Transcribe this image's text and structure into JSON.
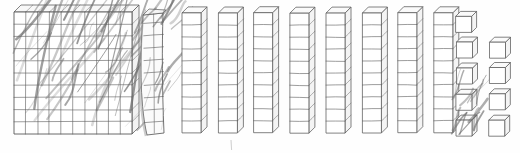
{
  "scene": {
    "title": "Base-Ten Blocks Place-Value Illustration",
    "medium": "pencil-sketch-scan",
    "canvas": {
      "width": 520,
      "height": 153
    },
    "background_color": "#fefefe",
    "ink_color": "#4a4a4a",
    "line_color": "#5a5a5a",
    "face_color": "#ffffff",
    "scribble_color": "#6b6b6b",
    "shadow_color": "#9a9a9a"
  },
  "legend": {
    "flat_name": "flat",
    "flat_value_label": "100",
    "rod_name": "rod",
    "rod_value_label": "10",
    "unit_name": "unit cube",
    "unit_value_label": "1"
  },
  "groups": [
    {
      "id": "flat-front",
      "kind": "flat",
      "label": "hundreds flat (scribbled over)",
      "count": 1,
      "unit_value": 100,
      "grid_rows": 10,
      "grid_cols": 10,
      "scribbled": true,
      "x": 14,
      "y": 12,
      "width": 118,
      "height": 122,
      "depth": 7
    },
    {
      "id": "flat-edge",
      "kind": "flat-edge-on",
      "label": "hundreds flat seen edge-on",
      "count": 1,
      "unit_value": 100,
      "grid_rows": 10,
      "grid_cols": 1,
      "scribbled": true,
      "x": 146,
      "y": 11,
      "width": 18,
      "height": 124,
      "depth": 6
    },
    {
      "id": "rods",
      "kind": "rod",
      "label": "tens rods",
      "count": 8,
      "unit_value": 10,
      "segments": 10,
      "x_start": 182,
      "x_step": 36,
      "y": 13,
      "width": 19,
      "height": 120,
      "depth": 6
    },
    {
      "id": "units-column-a",
      "kind": "unit",
      "label": "ones cubes column A",
      "count": 5,
      "unit_value": 1,
      "x": 456,
      "y_start": 16,
      "y_step": 26,
      "size": 16,
      "depth": 5,
      "scribbled_indices": [
        3,
        4
      ]
    },
    {
      "id": "units-column-b",
      "kind": "unit",
      "label": "ones cubes column B",
      "count": 4,
      "unit_value": 1,
      "x": 489,
      "y_start": 42,
      "y_step": 26,
      "size": 16,
      "depth": 5,
      "scribbled_indices": []
    }
  ],
  "tick_mark": {
    "label": "faint pencil tick",
    "x": 231,
    "y": 140,
    "height": 10
  },
  "totals": {
    "flats": 2,
    "rods": 8,
    "units": 9,
    "value_label": "289"
  }
}
